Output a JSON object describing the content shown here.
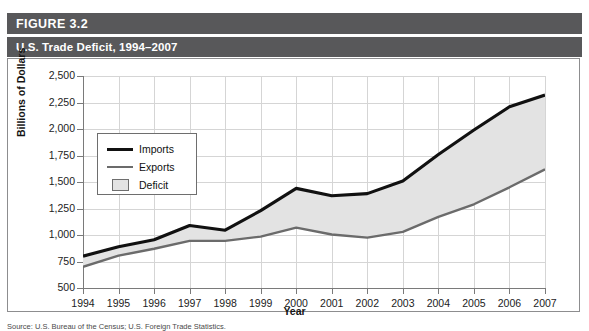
{
  "figure": {
    "label": "FIGURE 3.2",
    "title": "U.S. Trade Deficit, 1994–2007",
    "source": "Source: U.S. Bureau of the Census; U.S. Foreign Trade Statistics."
  },
  "legend": {
    "imports": "Imports",
    "exports": "Exports",
    "deficit": "Deficit"
  },
  "colors": {
    "header_bar": "#58585a",
    "imports_line": "#111111",
    "exports_line": "#6b6b6b",
    "deficit_fill": "#e3e3e3",
    "grid": "#d5d5d5",
    "axis": "#7a7a7a",
    "panel_border": "#8d8d8f"
  },
  "chart_data": {
    "type": "area",
    "title": "U.S. Trade Deficit, 1994–2007",
    "xlabel": "Year",
    "ylabel": "Billions of Dollars",
    "categories": [
      "1994",
      "1995",
      "1996",
      "1997",
      "1998",
      "1999",
      "2000",
      "2001",
      "2002",
      "2003",
      "2004",
      "2005",
      "2006",
      "2007"
    ],
    "ylim": [
      500,
      2500
    ],
    "yticks": [
      "500",
      "750",
      "1,000",
      "1,250",
      "1,500",
      "1,750",
      "2,000",
      "2,250",
      "2,500"
    ],
    "ytick_values": [
      500,
      750,
      1000,
      1250,
      1500,
      1750,
      2000,
      2250,
      2500
    ],
    "grid": true,
    "legend_position": "upper-left-inside",
    "series": [
      {
        "name": "Imports",
        "values": [
          800,
          890,
          955,
          1090,
          1045,
          1230,
          1440,
          1370,
          1390,
          1510,
          1760,
          1990,
          2210,
          2320
        ]
      },
      {
        "name": "Exports",
        "values": [
          700,
          805,
          870,
          945,
          945,
          985,
          1070,
          1005,
          975,
          1030,
          1170,
          1290,
          1450,
          1620
        ]
      }
    ],
    "band": {
      "name": "Deficit",
      "description": "Shaded area between Imports and Exports curves"
    }
  }
}
